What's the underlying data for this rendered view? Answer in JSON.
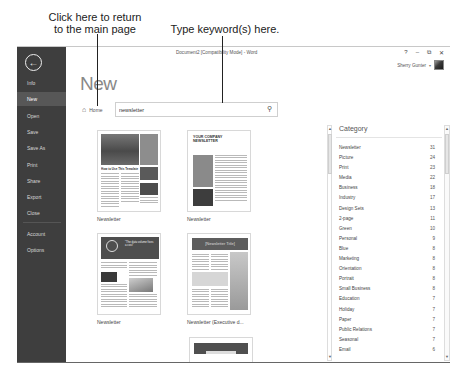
{
  "annotations": {
    "home_callout": [
      "Click here to return",
      "to the main page"
    ],
    "search_callout": "Type keyword(s) here."
  },
  "window": {
    "title": "Document2 [Compatibility Mode] - Word",
    "controls": {
      "help": "?",
      "minimize": "–",
      "restore": "⧉",
      "close": "✕"
    },
    "user_name": "Sherry Gunter",
    "user_caret": "▾"
  },
  "sidebar": {
    "back_icon": "back-arrow-icon",
    "items": [
      {
        "label": "Info",
        "active": false
      },
      {
        "label": "New",
        "active": true
      },
      {
        "label": "Open",
        "active": false
      },
      {
        "label": "Save",
        "active": false
      },
      {
        "label": "Save As",
        "active": false
      },
      {
        "label": "Print",
        "active": false
      },
      {
        "label": "Share",
        "active": false
      },
      {
        "label": "Export",
        "active": false
      },
      {
        "label": "Close",
        "active": false
      },
      {
        "label": "Account",
        "active": false
      },
      {
        "label": "Options",
        "active": false
      }
    ]
  },
  "main": {
    "title": "New",
    "home_label": "Home",
    "search": {
      "value": "newsletter",
      "placeholder": "Search for online templates"
    },
    "templates": [
      {
        "label": "Newsletter",
        "heading": "How to Use This Template"
      },
      {
        "label": "Newsletter",
        "heading": "YOUR COMPANY NEWSLETTER"
      },
      {
        "label": "Newsletter",
        "heading": "\"The data volume fixes a cost\""
      },
      {
        "label": "Newsletter (Executive d...",
        "heading": "[Newsletter Title]"
      },
      {
        "label": "",
        "heading": ""
      }
    ]
  },
  "category": {
    "header": "Category",
    "items": [
      {
        "name": "Newsletter",
        "count": "31"
      },
      {
        "name": "Picture",
        "count": "24"
      },
      {
        "name": "Print",
        "count": "23"
      },
      {
        "name": "Media",
        "count": "22"
      },
      {
        "name": "Business",
        "count": "18"
      },
      {
        "name": "Industry",
        "count": "17"
      },
      {
        "name": "Design Sets",
        "count": "13"
      },
      {
        "name": "2-page",
        "count": "11"
      },
      {
        "name": "Green",
        "count": "10"
      },
      {
        "name": "Personal",
        "count": "9"
      },
      {
        "name": "Blue",
        "count": "8"
      },
      {
        "name": "Marketing",
        "count": "8"
      },
      {
        "name": "Orientation",
        "count": "8"
      },
      {
        "name": "Portrait",
        "count": "8"
      },
      {
        "name": "Small Business",
        "count": "8"
      },
      {
        "name": "Education",
        "count": "7"
      },
      {
        "name": "Holiday",
        "count": "7"
      },
      {
        "name": "Paper",
        "count": "7"
      },
      {
        "name": "Public Relations",
        "count": "7"
      },
      {
        "name": "Seasonal",
        "count": "7"
      },
      {
        "name": "Email",
        "count": "6"
      }
    ]
  }
}
